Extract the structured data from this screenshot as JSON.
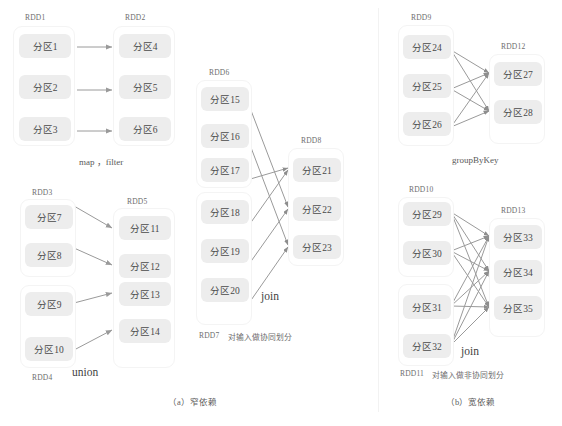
{
  "figure": {
    "title_a": "（a）窄依赖",
    "title_b": "（b）宽依赖"
  },
  "panel_a": {
    "narrow_label": "（a）窄依赖",
    "groups": {
      "rdd1": {
        "label": "RDD1",
        "partitions": [
          "分区1",
          "分区2",
          "分区3"
        ]
      },
      "rdd2": {
        "label": "RDD2",
        "partitions": [
          "分区4",
          "分区5",
          "分区6"
        ]
      },
      "rdd3": {
        "label": "RDD3",
        "partitions": [
          "分区7",
          "分区8"
        ]
      },
      "rdd4": {
        "label": "RDD4",
        "partitions": [
          "分区9",
          "分区10"
        ]
      },
      "rdd5": {
        "label": "RDD5",
        "partitions": [
          "分区11",
          "分区12",
          "分区13",
          "分区14"
        ]
      },
      "rdd6": {
        "label": "RDD6",
        "partitions": [
          "分区15",
          "分区16",
          "分区17"
        ]
      },
      "rdd7": {
        "label": "RDD7",
        "partitions": [
          "分区18",
          "分区19",
          "分区20"
        ]
      },
      "rdd8": {
        "label": "RDD8",
        "partitions": [
          "分区21",
          "分区22",
          "分区23"
        ]
      }
    },
    "ops": {
      "map_filter": "map ，filter",
      "union": "union",
      "join": "join"
    },
    "notes": {
      "rdd7_note": "对输入做协同划分"
    }
  },
  "panel_b": {
    "wide_label": "（b）宽依赖",
    "groups": {
      "rdd9": {
        "label": "RDD9",
        "partitions": [
          "分区24",
          "分区25",
          "分区26"
        ]
      },
      "rdd12": {
        "label": "RDD12",
        "partitions": [
          "分区27",
          "分区28"
        ]
      },
      "rdd10": {
        "label": "RDD10",
        "partitions": [
          "分区29",
          "分区30"
        ]
      },
      "rdd11": {
        "label": "RDD11",
        "partitions": [
          "分区31",
          "分区32"
        ]
      },
      "rdd13": {
        "label": "RDD13",
        "partitions": [
          "分区33",
          "分区34",
          "分区35"
        ]
      }
    },
    "ops": {
      "groupbykey": "groupByKey",
      "join": "join"
    },
    "notes": {
      "rdd11_note": "对输入做非协同划分"
    }
  },
  "colors": {
    "partition_fill": "#ededed",
    "group_border": "#f4f4f4",
    "edge_stroke": "#9a9a9a",
    "text": "#4a4a4a",
    "background": "#ffffff"
  }
}
